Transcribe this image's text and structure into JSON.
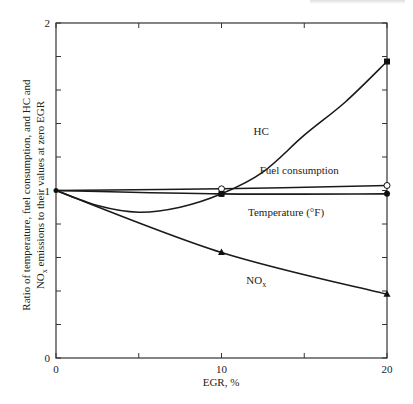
{
  "chart_data": {
    "type": "line",
    "title": "",
    "xlabel": "EGR, %",
    "ylabel_lines": [
      "Ratio of temperature, fuel consumption, and HC and",
      "NOx emissions to their values at zero EGR"
    ],
    "xlim": [
      0,
      20
    ],
    "ylim": [
      0,
      2
    ],
    "x_ticks": [
      0,
      5,
      10,
      15,
      20
    ],
    "x_tick_labels": [
      "0",
      "",
      "10",
      "",
      "20"
    ],
    "y_ticks": [
      0,
      0.2,
      0.4,
      0.6,
      0.8,
      1,
      1.2,
      1.4,
      1.6,
      1.8,
      2
    ],
    "y_tick_labels": [
      "0",
      "",
      "",
      "",
      "",
      "1",
      "",
      "",
      "",
      "",
      "2"
    ],
    "grid": false,
    "legend": "inline labels",
    "series": [
      {
        "name": "HC",
        "label": "HC",
        "marker": "square-filled",
        "x": [
          0,
          2.5,
          5,
          7.5,
          10,
          12.5,
          15,
          17.5,
          20
        ],
        "values": [
          1.0,
          0.91,
          0.87,
          0.9,
          0.98,
          1.11,
          1.33,
          1.53,
          1.77
        ],
        "marker_points": [
          [
            0,
            1.0
          ],
          [
            10,
            0.98
          ],
          [
            20,
            1.77
          ]
        ],
        "label_pos": [
          12.4,
          1.33
        ]
      },
      {
        "name": "Fuel consumption",
        "label": "Fuel consumption",
        "marker": "circle-open",
        "x": [
          0,
          10,
          20
        ],
        "values": [
          1.0,
          1.01,
          1.03
        ],
        "marker_points": [
          [
            0,
            1.0
          ],
          [
            10,
            1.01
          ],
          [
            20,
            1.03
          ]
        ],
        "label_pos": [
          14.7,
          1.1
        ]
      },
      {
        "name": "Temperature (°F)",
        "label": "Temperature (°F)",
        "marker": "circle-filled",
        "x": [
          0,
          10,
          20
        ],
        "values": [
          1.0,
          0.98,
          0.98
        ],
        "marker_points": [
          [
            0,
            1.0
          ],
          [
            10,
            0.98
          ],
          [
            20,
            0.98
          ]
        ],
        "label_pos": [
          13.9,
          0.85
        ]
      },
      {
        "name": "NOx",
        "label": "NO",
        "label_sub": "x",
        "marker": "triangle-filled",
        "x": [
          0,
          10,
          20
        ],
        "values": [
          1.0,
          0.63,
          0.38
        ],
        "marker_points": [
          [
            0,
            1.0
          ],
          [
            10,
            0.63
          ],
          [
            20,
            0.38
          ]
        ],
        "label_pos": [
          12.1,
          0.44
        ]
      }
    ]
  }
}
